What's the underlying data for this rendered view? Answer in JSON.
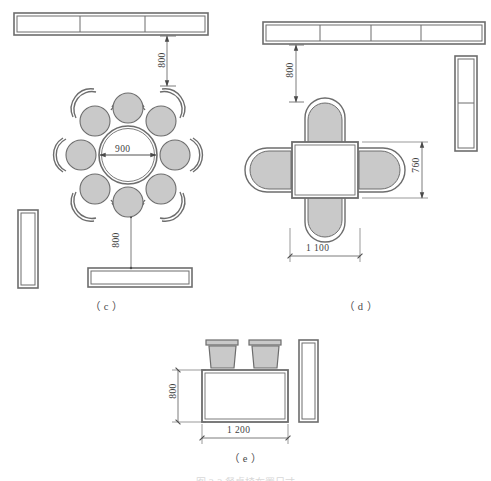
{
  "page": {
    "width": 491,
    "height": 481,
    "background": "#ffffff",
    "line_color": "#4a4a4a",
    "fill_color": "#c9c9c9",
    "partial_caption": "图 3-3 餐桌椅布置尺寸"
  },
  "figures": [
    {
      "id": "c",
      "label": "（ c ）",
      "description": "round-dining-table-eight-chairs-plan",
      "table": {
        "shape": "circle",
        "diameter_label": "900"
      },
      "chairs": {
        "count": 8,
        "type": "round-stool-with-curved-back"
      },
      "dimensions": [
        {
          "name": "clearance-top",
          "value": "800",
          "orientation": "vertical"
        },
        {
          "name": "table-diameter",
          "value": "900",
          "orientation": "horizontal"
        },
        {
          "name": "clearance-bottom",
          "value": "800",
          "orientation": "vertical"
        }
      ],
      "cabinets": [
        {
          "name": "top-counter",
          "segments": 3,
          "orientation": "horizontal"
        },
        {
          "name": "left-counter",
          "segments": 1,
          "orientation": "vertical"
        },
        {
          "name": "bottom-counter",
          "segments": 1,
          "orientation": "horizontal"
        }
      ]
    },
    {
      "id": "d",
      "label": "（ d ）",
      "description": "rectangular-dining-table-four-chairs-plan",
      "table": {
        "shape": "rectangle",
        "width_label": "1 100",
        "depth_label": "760"
      },
      "chairs": {
        "count": 4,
        "type": "d-shaped-armchair"
      },
      "dimensions": [
        {
          "name": "clearance-top",
          "value": "800",
          "orientation": "vertical"
        },
        {
          "name": "table-depth",
          "value": "760",
          "orientation": "vertical"
        },
        {
          "name": "table-width",
          "value": "1 100",
          "orientation": "horizontal"
        }
      ],
      "cabinets": [
        {
          "name": "top-counter",
          "segments": 4,
          "orientation": "horizontal"
        },
        {
          "name": "right-counter",
          "segments": 2,
          "orientation": "vertical"
        }
      ]
    },
    {
      "id": "e",
      "label": "（ e ）",
      "description": "rectangular-table-two-chairs-plan",
      "table": {
        "shape": "rectangle",
        "width_label": "1 200",
        "depth_label": "800"
      },
      "chairs": {
        "count": 2,
        "type": "square-back-chair"
      },
      "dimensions": [
        {
          "name": "table-depth",
          "value": "800",
          "orientation": "vertical"
        },
        {
          "name": "table-width",
          "value": "1 200",
          "orientation": "horizontal"
        }
      ],
      "cabinets": [
        {
          "name": "right-counter",
          "segments": 1,
          "orientation": "vertical"
        }
      ]
    }
  ]
}
